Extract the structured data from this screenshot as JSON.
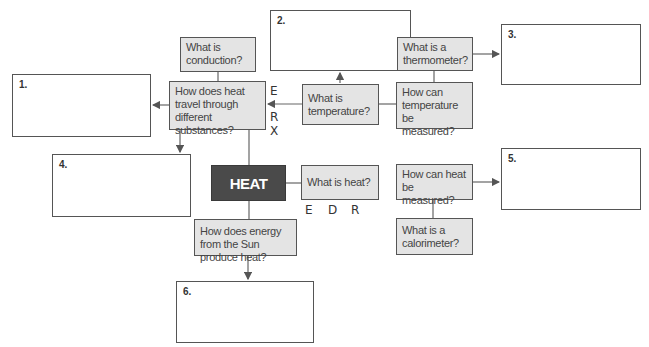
{
  "center_topic": "HEAT",
  "questions": {
    "conduction": "What is conduction?",
    "heat_travel": "How does heat travel through different substances?",
    "temperature": "What is temperature?",
    "thermometer": "What is a thermometer?",
    "measure_temperature": "How can temperature be measured?",
    "what_is_heat": "What is heat?",
    "measure_heat": "How can heat be measured?",
    "calorimeter": "What is a calorimeter?",
    "sun_energy": "How does energy from the Sun produce heat?"
  },
  "answer_boxes": [
    {
      "label": "1."
    },
    {
      "label": "2."
    },
    {
      "label": "3."
    },
    {
      "label": "4."
    },
    {
      "label": "5."
    },
    {
      "label": "6."
    }
  ],
  "annotations": {
    "vertical_letters": [
      "E",
      "R",
      "X"
    ],
    "horizontal_letters": [
      "E",
      "D",
      "R"
    ]
  },
  "colors": {
    "center_fill": "#4a4a4a",
    "question_fill": "#e4e4e4",
    "border": "#555555"
  }
}
